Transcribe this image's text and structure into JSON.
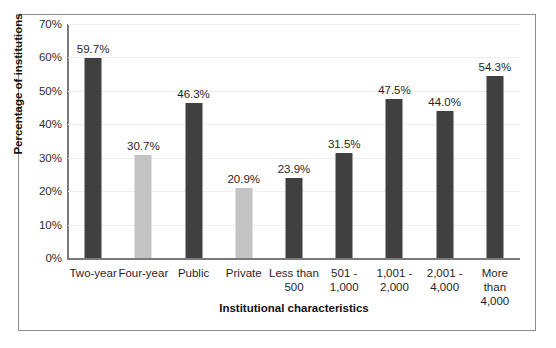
{
  "chart_data": {
    "type": "bar",
    "title": "",
    "xlabel": "Institutional characteristics",
    "ylabel": "Percentage of institutions",
    "categories": [
      "Two-year",
      "Four-year",
      "Public",
      "Private",
      "Less than\n500",
      "501 -\n1,000",
      "1,001 -\n2,000",
      "2,001 -\n4,000",
      "More than\n4,000"
    ],
    "values": [
      59.7,
      30.7,
      46.3,
      20.9,
      23.9,
      31.5,
      47.5,
      44.0,
      54.3
    ],
    "value_labels": [
      "59.7%",
      "30.7%",
      "46.3%",
      "20.9%",
      "23.9%",
      "31.5%",
      "47.5%",
      "44.0%",
      "54.3%"
    ],
    "bar_colors": [
      "#404040",
      "#c3c3c3",
      "#404040",
      "#c3c3c3",
      "#404040",
      "#404040",
      "#404040",
      "#404040",
      "#404040"
    ],
    "ylim": [
      0,
      70
    ],
    "ytick_labels": [
      "70%",
      "60%",
      "50%",
      "40%",
      "30%",
      "20%",
      "10%",
      "0%"
    ],
    "ytick_values": [
      70,
      60,
      50,
      40,
      30,
      20,
      10,
      0
    ],
    "grid": true,
    "legend": "none",
    "frame_color": "#8c8c8c",
    "axis_color": "#7a7a7a",
    "gridline_color": "#eeeeee"
  }
}
